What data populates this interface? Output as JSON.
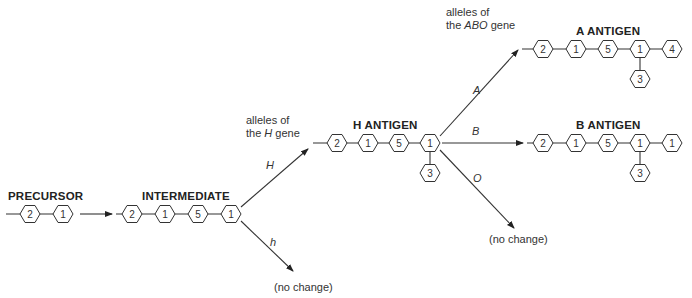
{
  "labels": {
    "precursor": "PRECURSOR",
    "intermediate": "INTERMEDIATE",
    "h_antigen": "H   ANTIGEN",
    "a_antigen": "A   ANTIGEN",
    "b_antigen": "B   ANTIGEN",
    "h_gene_line1": "alleles of",
    "h_gene_line2_pre": "the ",
    "h_gene_line2_ital": "H",
    "h_gene_line2_post": " gene",
    "abo_gene_line1": "alleles of",
    "abo_gene_line2_pre": "the ",
    "abo_gene_line2_ital": "ABO",
    "abo_gene_line2_post": " gene",
    "no_change_h": "(no change)",
    "no_change_o": "(no change)"
  },
  "alleles": {
    "H": "H",
    "h": "h",
    "A": "A",
    "B": "B",
    "O": "O"
  },
  "chains": {
    "precursor": [
      "2",
      "1"
    ],
    "intermediate": [
      "2",
      "1",
      "5",
      "1"
    ],
    "h_antigen": [
      "2",
      "1",
      "5",
      "1"
    ],
    "h_antigen_branch": "3",
    "a_antigen": [
      "2",
      "1",
      "5",
      "1",
      "4"
    ],
    "a_antigen_branch": "3",
    "b_antigen": [
      "2",
      "1",
      "5",
      "1",
      "1"
    ],
    "b_antigen_branch": "3"
  }
}
